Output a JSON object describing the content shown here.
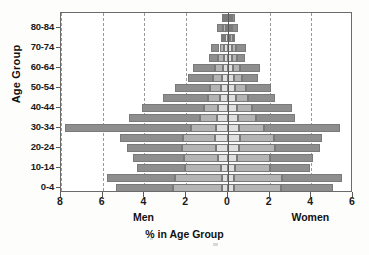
{
  "chart_data": {
    "type": "bar",
    "subtype": "population-pyramid",
    "title": "",
    "xlabel": "% in Age Group",
    "ylabel": "Age Group",
    "left_group_label": "Men",
    "right_group_label": "Women",
    "xlim": [
      -8,
      6
    ],
    "xticks": [
      8,
      6,
      4,
      2,
      0,
      2,
      4,
      6
    ],
    "xtick_values": [
      -8,
      -6,
      -4,
      -2,
      0,
      2,
      4,
      6
    ],
    "grid": "vertical-dashed",
    "legend": "none",
    "categories": [
      "0-4",
      "5-9",
      "10-14",
      "15-19",
      "20-24",
      "25-29",
      "30-34",
      "35-39",
      "40-44",
      "45-49",
      "50-54",
      "55-59",
      "60-64",
      "65-69",
      "70-74",
      "75-79",
      "80-84",
      "85+"
    ],
    "ytick_labels": [
      "0-4",
      "10-14",
      "20-24",
      "30-34",
      "40-44",
      "50-54",
      "60-64",
      "70-74",
      "80-84"
    ],
    "colors": {
      "outer_segment": "#8e8e8e",
      "middle_segment": "#b4b4b4",
      "inner_segment": "#dedede",
      "segment_border": "#7a7a7a",
      "axis": "#5a5a5a",
      "gridline": "#9a9a9a",
      "background": "#ffffff"
    },
    "series": [
      {
        "name": "Men",
        "side": "left",
        "stack_order": [
          "inner",
          "middle",
          "outer"
        ],
        "stacks": [
          {
            "category": "0-4",
            "inner": 0.3,
            "middle": 2.35,
            "outer": 2.7,
            "total": 5.35
          },
          {
            "category": "5-9",
            "inner": 0.3,
            "middle": 2.25,
            "outer": 3.25,
            "total": 5.8
          },
          {
            "category": "10-14",
            "inner": 0.35,
            "middle": 1.7,
            "outer": 2.3,
            "total": 4.35
          },
          {
            "category": "15-19",
            "inner": 0.45,
            "middle": 1.65,
            "outer": 2.45,
            "total": 4.55
          },
          {
            "category": "20-24",
            "inner": 0.55,
            "middle": 1.65,
            "outer": 2.65,
            "total": 4.85
          },
          {
            "category": "25-29",
            "inner": 0.6,
            "middle": 1.55,
            "outer": 3.0,
            "total": 5.15
          },
          {
            "category": "30-34",
            "inner": 0.55,
            "middle": 1.2,
            "outer": 6.05,
            "total": 7.8
          },
          {
            "category": "35-39",
            "inner": 0.5,
            "middle": 0.85,
            "outer": 3.4,
            "total": 4.75
          },
          {
            "category": "40-44",
            "inner": 0.45,
            "middle": 0.7,
            "outer": 2.95,
            "total": 4.1
          },
          {
            "category": "45-49",
            "inner": 0.4,
            "middle": 0.55,
            "outer": 2.15,
            "total": 3.1
          },
          {
            "category": "50-54",
            "inner": 0.35,
            "middle": 0.5,
            "outer": 1.7,
            "total": 2.55
          },
          {
            "category": "55-59",
            "inner": 0.3,
            "middle": 0.4,
            "outer": 1.2,
            "total": 1.9
          },
          {
            "category": "60-64",
            "inner": 0.25,
            "middle": 0.35,
            "outer": 1.05,
            "total": 1.65
          },
          {
            "category": "65-69",
            "inner": 0.2,
            "middle": 0.25,
            "outer": 0.45,
            "total": 0.9
          },
          {
            "category": "70-74",
            "inner": 0.18,
            "middle": 0.22,
            "outer": 0.4,
            "total": 0.8
          },
          {
            "category": "75-79",
            "inner": 0.12,
            "middle": 0.13,
            "outer": 0.1,
            "total": 0.35
          },
          {
            "category": "80-84",
            "inner": 0.1,
            "middle": 0.12,
            "outer": 0.28,
            "total": 0.5
          },
          {
            "category": "85+",
            "inner": 0.08,
            "middle": 0.1,
            "outer": 0.12,
            "total": 0.3
          }
        ]
      },
      {
        "name": "Women",
        "side": "right",
        "stack_order": [
          "inner",
          "middle",
          "outer"
        ],
        "stacks": [
          {
            "category": "0-4",
            "inner": 0.3,
            "middle": 2.25,
            "outer": 2.5,
            "total": 5.05
          },
          {
            "category": "5-9",
            "inner": 0.3,
            "middle": 2.3,
            "outer": 2.85,
            "total": 5.45
          },
          {
            "category": "10-14",
            "inner": 0.35,
            "middle": 1.65,
            "outer": 1.95,
            "total": 3.95
          },
          {
            "category": "15-19",
            "inner": 0.45,
            "middle": 1.55,
            "outer": 2.1,
            "total": 4.1
          },
          {
            "category": "20-24",
            "inner": 0.55,
            "middle": 1.7,
            "outer": 2.15,
            "total": 4.4
          },
          {
            "category": "25-29",
            "inner": 0.6,
            "middle": 1.6,
            "outer": 2.3,
            "total": 4.5
          },
          {
            "category": "30-34",
            "inner": 0.55,
            "middle": 1.2,
            "outer": 3.65,
            "total": 5.4
          },
          {
            "category": "35-39",
            "inner": 0.5,
            "middle": 0.85,
            "outer": 1.85,
            "total": 3.2
          },
          {
            "category": "40-44",
            "inner": 0.45,
            "middle": 0.7,
            "outer": 1.95,
            "total": 3.1
          },
          {
            "category": "45-49",
            "inner": 0.4,
            "middle": 0.55,
            "outer": 1.3,
            "total": 2.25
          },
          {
            "category": "50-54",
            "inner": 0.35,
            "middle": 0.5,
            "outer": 1.2,
            "total": 2.05
          },
          {
            "category": "55-59",
            "inner": 0.3,
            "middle": 0.4,
            "outer": 0.75,
            "total": 1.45
          },
          {
            "category": "60-64",
            "inner": 0.25,
            "middle": 0.35,
            "outer": 0.95,
            "total": 1.55
          },
          {
            "category": "65-69",
            "inner": 0.2,
            "middle": 0.25,
            "outer": 0.35,
            "total": 0.8
          },
          {
            "category": "70-74",
            "inner": 0.18,
            "middle": 0.22,
            "outer": 0.45,
            "total": 0.85
          },
          {
            "category": "75-79",
            "inner": 0.12,
            "middle": 0.13,
            "outer": 0.1,
            "total": 0.35
          },
          {
            "category": "80-84",
            "inner": 0.1,
            "middle": 0.12,
            "outer": 0.25,
            "total": 0.47
          },
          {
            "category": "85+",
            "inner": 0.08,
            "middle": 0.1,
            "outer": 0.14,
            "total": 0.32
          }
        ]
      }
    ]
  }
}
